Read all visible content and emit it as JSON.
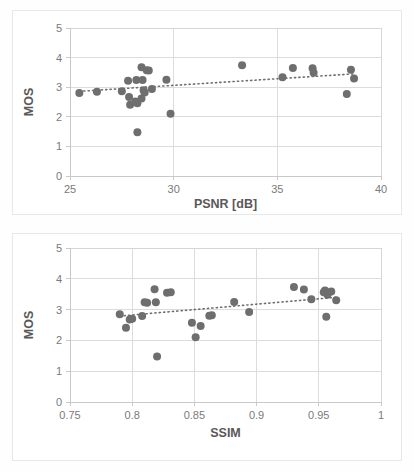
{
  "page": {
    "background_color": "#ffffff",
    "marker_color": "#6e6e6e",
    "grid_color": "#dcdcdc",
    "axis_color": "#c9c9c9",
    "text_color": "#595959"
  },
  "charts": [
    {
      "id": "psnr",
      "name": "mos-vs-psnr-scatter",
      "title": "",
      "xlabel": "PSNR [dB]",
      "ylabel": "MOS",
      "xticks": [
        "25",
        "30",
        "35",
        "40"
      ],
      "yticks": [
        "0",
        "1",
        "2",
        "3",
        "4",
        "5"
      ]
    },
    {
      "id": "ssim",
      "name": "mos-vs-ssim-scatter",
      "title": "",
      "xlabel": "SSIM",
      "ylabel": "MOS",
      "xticks": [
        "0.75",
        "0.8",
        "0.85",
        "0.9",
        "0.95",
        "1"
      ],
      "yticks": [
        "0",
        "1",
        "2",
        "3",
        "4",
        "5"
      ]
    }
  ],
  "chart_data": [
    {
      "type": "scatter",
      "id": "psnr",
      "title": "",
      "xlabel": "PSNR [dB]",
      "ylabel": "MOS",
      "xlim": [
        25,
        40
      ],
      "ylim": [
        0,
        5
      ],
      "xticks": [
        25,
        30,
        35,
        40
      ],
      "yticks": [
        0,
        1,
        2,
        3,
        4,
        5
      ],
      "grid": true,
      "legend": null,
      "series": [
        {
          "name": "MOS vs PSNR",
          "marker": "circle",
          "color": "#6e6e6e",
          "points": [
            [
              25.45,
              2.8
            ],
            [
              26.3,
              2.85
            ],
            [
              27.5,
              2.86
            ],
            [
              27.8,
              3.22
            ],
            [
              27.85,
              2.67
            ],
            [
              27.9,
              2.41
            ],
            [
              28.15,
              2.52
            ],
            [
              28.2,
              3.24
            ],
            [
              28.25,
              2.46
            ],
            [
              28.25,
              1.48
            ],
            [
              28.45,
              3.67
            ],
            [
              28.45,
              2.62
            ],
            [
              28.5,
              3.24
            ],
            [
              28.55,
              2.9
            ],
            [
              28.6,
              2.82
            ],
            [
              28.7,
              3.57
            ],
            [
              28.8,
              3.56
            ],
            [
              28.95,
              2.94
            ],
            [
              29.65,
              3.25
            ],
            [
              29.85,
              2.1
            ],
            [
              33.3,
              3.74
            ],
            [
              35.25,
              3.34
            ],
            [
              35.75,
              3.65
            ],
            [
              36.7,
              3.64
            ],
            [
              36.75,
              3.49
            ],
            [
              38.35,
              2.77
            ],
            [
              38.55,
              3.59
            ],
            [
              38.7,
              3.29
            ]
          ]
        }
      ],
      "trendline": {
        "type": "linear",
        "style": "dotted",
        "color": "#6e6e6e",
        "x_start": 25.45,
        "y_start": 2.86,
        "x_end": 38.7,
        "y_end": 3.45
      }
    },
    {
      "type": "scatter",
      "id": "ssim",
      "title": "",
      "xlabel": "SSIM",
      "ylabel": "MOS",
      "xlim": [
        0.75,
        1.0
      ],
      "ylim": [
        0,
        5
      ],
      "xticks": [
        0.75,
        0.8,
        0.85,
        0.9,
        0.95,
        1
      ],
      "yticks": [
        0,
        1,
        2,
        3,
        4,
        5
      ],
      "grid": true,
      "legend": null,
      "series": [
        {
          "name": "MOS vs SSIM",
          "marker": "circle",
          "color": "#6e6e6e",
          "points": [
            [
              0.79,
              2.85
            ],
            [
              0.795,
              2.41
            ],
            [
              0.798,
              2.68
            ],
            [
              0.8,
              2.7
            ],
            [
              0.808,
              2.79
            ],
            [
              0.81,
              3.24
            ],
            [
              0.812,
              3.22
            ],
            [
              0.818,
              3.66
            ],
            [
              0.819,
              3.24
            ],
            [
              0.82,
              1.48
            ],
            [
              0.828,
              3.55
            ],
            [
              0.831,
              3.56
            ],
            [
              0.848,
              2.57
            ],
            [
              0.851,
              2.1
            ],
            [
              0.855,
              2.47
            ],
            [
              0.862,
              2.8
            ],
            [
              0.864,
              2.82
            ],
            [
              0.882,
              3.25
            ],
            [
              0.894,
              2.92
            ],
            [
              0.93,
              3.73
            ],
            [
              0.938,
              3.65
            ],
            [
              0.944,
              3.34
            ],
            [
              0.954,
              3.56
            ],
            [
              0.955,
              3.62
            ],
            [
              0.956,
              2.77
            ],
            [
              0.957,
              3.48
            ],
            [
              0.96,
              3.59
            ],
            [
              0.964,
              3.3
            ]
          ]
        }
      ],
      "trendline": {
        "type": "linear",
        "style": "dotted",
        "color": "#6e6e6e",
        "x_start": 0.79,
        "y_start": 2.79,
        "x_end": 0.964,
        "y_end": 3.4
      }
    }
  ]
}
